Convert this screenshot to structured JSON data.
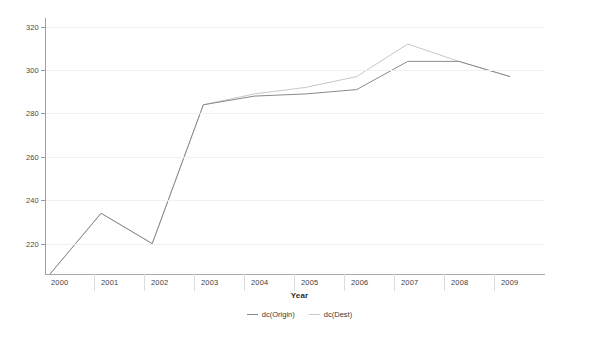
{
  "chart_data": {
    "type": "line",
    "title": "",
    "xlabel": "Year",
    "ylabel": "",
    "x": [
      2000,
      2001,
      2002,
      2003,
      2004,
      2005,
      2006,
      2007,
      2008,
      2009
    ],
    "xtick_labels": [
      "2000",
      "2001",
      "2002",
      "2003",
      "2004",
      "2005",
      "2006",
      "2007",
      "2008",
      "2009"
    ],
    "ytick_labels": [
      "220",
      "240",
      "260",
      "280",
      "300",
      "320"
    ],
    "yticks": [
      220,
      240,
      260,
      280,
      300,
      320
    ],
    "ylim": [
      206,
      324
    ],
    "xlim": [
      2000,
      2009
    ],
    "grid": true,
    "legend_position": "bottom",
    "series": [
      {
        "name": "dc(Origin)",
        "color": "#8a8a8a",
        "values": [
          206,
          234,
          220,
          284,
          288,
          289,
          291,
          304,
          304,
          297
        ]
      },
      {
        "name": "dc(Dest)",
        "color": "#c8c8c8",
        "values": [
          206,
          234,
          220,
          284,
          289,
          292,
          297,
          312,
          304,
          297
        ]
      }
    ]
  },
  "axis": {
    "x_title": "Year"
  },
  "legend": {
    "items": [
      {
        "label": "dc(Origin)",
        "color": "#8a8a8a"
      },
      {
        "label": "dc(Dest)",
        "color": "#c8c8c8"
      }
    ]
  }
}
